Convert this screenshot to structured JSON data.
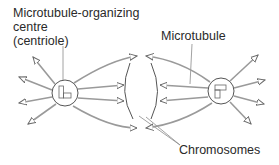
{
  "diagram": {
    "labels": {
      "mtoc_line1": "Microtubule-organizing",
      "mtoc_line2": "centre",
      "mtoc_line3": "(centriole)",
      "microtubule": "Microtubule",
      "chromosomes": "Chromosomes"
    },
    "colors": {
      "text": "#2a2a2a",
      "line": "#8a8a8a",
      "circle": "#555555"
    },
    "centrioles": [
      {
        "name": "left",
        "cx": 65,
        "cy": 93,
        "r": 13
      },
      {
        "name": "right",
        "cx": 221,
        "cy": 91,
        "r": 13
      }
    ]
  }
}
